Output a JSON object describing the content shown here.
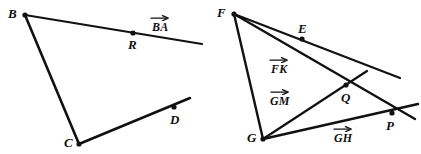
{
  "figure": {
    "background_color": "#ffffff",
    "stroke_color": "#111111",
    "width": 421,
    "height": 154
  },
  "left_figure": {
    "name": "triangle-BCD-with-vector-BA",
    "points": [
      {
        "id": "B",
        "label": "B",
        "x": 25,
        "y": 15,
        "label_x": 8,
        "label_y": 7,
        "dot": true
      },
      {
        "id": "R",
        "label": "R",
        "x": 133,
        "y": 33,
        "label_x": 128,
        "label_y": 38,
        "dot": true
      },
      {
        "id": "D",
        "label": "D",
        "x": 174,
        "y": 107,
        "label_x": 170,
        "label_y": 113,
        "dot": true
      },
      {
        "id": "C",
        "label": "C",
        "x": 79,
        "y": 144,
        "label_x": 64,
        "label_y": 136,
        "dot": true
      }
    ],
    "vectors": [
      {
        "id": "BA",
        "label": "BA",
        "label_x": 152,
        "label_y": 14
      }
    ],
    "segments": [
      {
        "id": "ray-B-through-R",
        "x1": 25,
        "y1": 15,
        "x2": 202,
        "y2": 44,
        "width": 2.2
      },
      {
        "id": "segment-B-to-C",
        "x1": 25,
        "y1": 15,
        "x2": 79,
        "y2": 144,
        "width": 2.6
      },
      {
        "id": "ray-C-through-D",
        "x1": 79,
        "y1": 144,
        "x2": 190,
        "y2": 98,
        "width": 2.6
      }
    ]
  },
  "right_figure": {
    "name": "triangle-FGP-with-vectors-FK-GM-GH",
    "points": [
      {
        "id": "F",
        "label": "F",
        "x": 234,
        "y": 14,
        "label_x": 217,
        "label_y": 6,
        "dot": true
      },
      {
        "id": "E",
        "label": "E",
        "x": 302,
        "y": 39,
        "label_x": 298,
        "label_y": 22,
        "dot": true
      },
      {
        "id": "Q",
        "label": "Q",
        "x": 346,
        "y": 85,
        "label_x": 341,
        "label_y": 91,
        "dot": true
      },
      {
        "id": "G",
        "label": "G",
        "x": 263,
        "y": 139,
        "label_x": 247,
        "label_y": 131,
        "dot": true
      },
      {
        "id": "P",
        "label": "P",
        "x": 392,
        "y": 113,
        "label_x": 386,
        "label_y": 119,
        "dot": true
      }
    ],
    "vectors": [
      {
        "id": "FK",
        "label": "FK",
        "label_x": 271,
        "label_y": 56
      },
      {
        "id": "GM",
        "label": "GM",
        "label_x": 270,
        "label_y": 88
      },
      {
        "id": "GH",
        "label": "GH",
        "label_x": 334,
        "label_y": 125
      }
    ],
    "segments": [
      {
        "id": "ray-F-through-E",
        "x1": 234,
        "y1": 14,
        "x2": 400,
        "y2": 78,
        "width": 2.2
      },
      {
        "id": "ray-F-through-Q",
        "x1": 234,
        "y1": 14,
        "x2": 415,
        "y2": 119,
        "width": 2.4
      },
      {
        "id": "segment-F-to-G",
        "x1": 234,
        "y1": 14,
        "x2": 263,
        "y2": 139,
        "width": 2.4
      },
      {
        "id": "ray-G-through-Q",
        "x1": 263,
        "y1": 139,
        "x2": 367,
        "y2": 71,
        "width": 2.2
      },
      {
        "id": "ray-G-through-P",
        "x1": 263,
        "y1": 139,
        "x2": 418,
        "y2": 104,
        "width": 2.4
      }
    ]
  }
}
